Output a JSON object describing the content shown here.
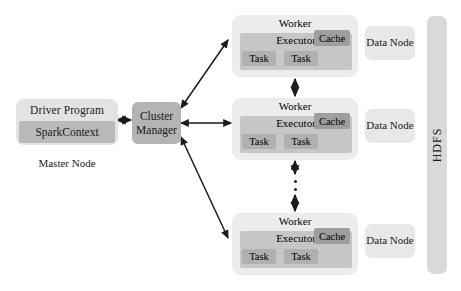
{
  "diagram": {
    "master": {
      "driver_label": "Driver Program",
      "sparkcontext_label": "SparkContext",
      "node_label": "Master Node"
    },
    "cluster_manager": {
      "line1": "Cluster",
      "line2": "Manager"
    },
    "workers": [
      {
        "title": "Worker",
        "executor": "Executor",
        "cache": "Cache",
        "tasks": [
          "Task",
          "Task"
        ],
        "data_node": "Data Node"
      },
      {
        "title": "Worker",
        "executor": "Executor",
        "cache": "Cache",
        "tasks": [
          "Task",
          "Task"
        ],
        "data_node": "Data Node"
      },
      {
        "title": "Worker",
        "executor": "Executor",
        "cache": "Cache",
        "tasks": [
          "Task",
          "Task"
        ],
        "data_node": "Data Node"
      }
    ],
    "storage": {
      "label": "HDFS"
    },
    "colors": {
      "background": "#ffffff",
      "driver_outer": "#e3e3e3",
      "sparkcontext": "#b9b9b9",
      "cluster_manager": "#b4b4b4",
      "worker_outer": "#ececec",
      "executor": "#c6c6c6",
      "cache": "#9e9e9e",
      "task": "#b0b0b0",
      "data_node": "#e8e8e8",
      "hdfs": "#d9d9d9",
      "arrow": "#1c1c1c",
      "text": "#1a1a1a"
    }
  }
}
